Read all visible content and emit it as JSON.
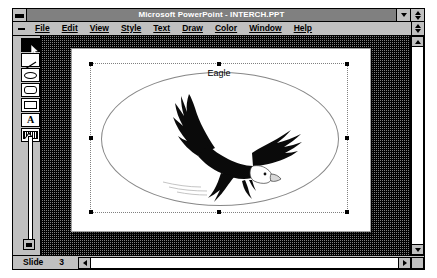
{
  "window": {
    "title": "Microsoft PowerPoint - INTERCH.PPT",
    "sysmenu_icon": "system-menu-icon",
    "minimize_icon": "minimize-icon",
    "restore_icon": "restore-icon"
  },
  "menu": {
    "doc_sysmenu_icon": "document-system-menu-icon",
    "items": [
      {
        "label": "File",
        "accel": "F"
      },
      {
        "label": "Edit",
        "accel": "E"
      },
      {
        "label": "View",
        "accel": "V"
      },
      {
        "label": "Style",
        "accel": "y"
      },
      {
        "label": "Text",
        "accel": "T"
      },
      {
        "label": "Draw",
        "accel": "D"
      },
      {
        "label": "Color",
        "accel": "C"
      },
      {
        "label": "Window",
        "accel": "W"
      },
      {
        "label": "Help",
        "accel": "H"
      }
    ]
  },
  "toolbar": {
    "tools": [
      {
        "name": "selection-tool",
        "icon": "arrow-icon",
        "selected": true
      },
      {
        "name": "line-tool",
        "icon": "line-icon",
        "selected": false
      },
      {
        "name": "ellipse-tool",
        "icon": "ellipse-icon",
        "selected": false
      },
      {
        "name": "rounded-rectangle-tool",
        "icon": "rounded-rect-icon",
        "selected": false
      },
      {
        "name": "rectangle-tool",
        "icon": "rectangle-icon",
        "selected": false
      },
      {
        "name": "text-tool",
        "icon": "text-a-icon",
        "selected": false,
        "glyph": "A"
      },
      {
        "name": "text-box-tool",
        "icon": "text-box-icon",
        "selected": false
      }
    ],
    "zoom_slider": {
      "name": "zoom-slider",
      "top_handle_icon": "slider-up-handle-icon",
      "bottom_handle_icon": "slider-thumb-icon"
    }
  },
  "slide": {
    "title": "Eagle",
    "shape": "ellipse",
    "image_alt": "bald-eagle-in-flight",
    "selected": true
  },
  "status": {
    "label": "Slide",
    "number": "3",
    "prev_icon": "left-arrow-icon",
    "next_icon": "right-arrow-icon"
  },
  "scrollbars": {
    "vertical_up_icon": "up-arrow-icon",
    "vertical_down_icon": "down-arrow-icon",
    "menu_scroll_icon": "up-down-arrow-icon",
    "horizontal_left_icon": "left-arrow-icon",
    "horizontal_right_icon": "right-arrow-icon"
  },
  "colors": {
    "window_face": "#c0c0c0",
    "title_bar": "#808080",
    "title_text": "#ffffff",
    "desktop_hatch": "#7f7f7f",
    "slide_paper": "#ffffff",
    "outline": "#000000"
  }
}
